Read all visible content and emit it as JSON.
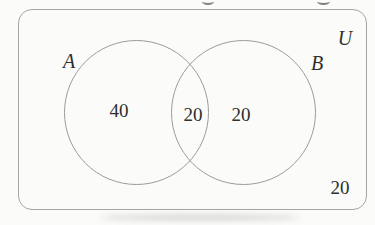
{
  "figure": {
    "type": "venn-diagram",
    "universe": {
      "label": "U",
      "outside_value": "20"
    },
    "sets": [
      {
        "label": "A",
        "only_value": "40"
      },
      {
        "label": "B",
        "only_value": "20"
      }
    ],
    "intersection_value": "20"
  },
  "colors": {
    "background": "#fbfbf9",
    "frame_stroke": "#a5a5a3",
    "circle_stroke": "#9b9b99",
    "text": "#2f2f2d"
  }
}
